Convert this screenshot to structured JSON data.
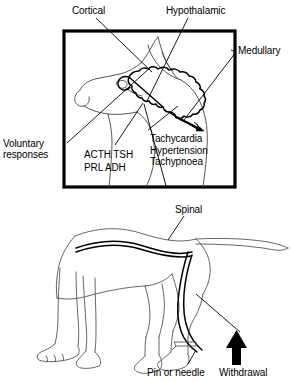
{
  "figure": {
    "type": "line-drawing-diagram",
    "background_color": "#ffffff",
    "ink_color": "#000000",
    "panels": [
      {
        "id": "head-panel",
        "description": "Boxed lateral view of a dog's head showing the brain outline with leader lines to named central nervous system levels",
        "border_color": "#000000"
      },
      {
        "id": "body-panel",
        "description": "Lateral view of a whole dog showing the spinal cord and a spinal reflex arc to the hind limb",
        "border_color": "none"
      }
    ]
  },
  "labels": {
    "cortical": "Cortical",
    "hypothalamic": "Hypothalamic",
    "medullary": "Medullary",
    "voluntary_responses": "Voluntary\nresponses",
    "hormones": "ACTH TSH\nPRL   ADH",
    "autonomic_responses": "Tachycardia\nHypertension\nTachypnoea",
    "spinal": "Spinal",
    "pin_or_needle": "Pin or needle",
    "withdrawal": "Withdrawal"
  },
  "annotations": {
    "hormone_list": [
      "ACTH",
      "TSH",
      "PRL",
      "ADH"
    ],
    "autonomic_list": [
      "Tachycardia",
      "Hypertension",
      "Tachypnoea"
    ],
    "brain_levels": [
      "Cortical",
      "Hypothalamic",
      "Medullary",
      "Spinal"
    ],
    "stimulus": "Pin or needle",
    "response": "Withdrawal"
  },
  "icons": {
    "medullary_arrow": "arrowhead-down-right-icon",
    "withdrawal_arrow": "arrow-up-icon",
    "needle": "pin-needle-icon"
  }
}
